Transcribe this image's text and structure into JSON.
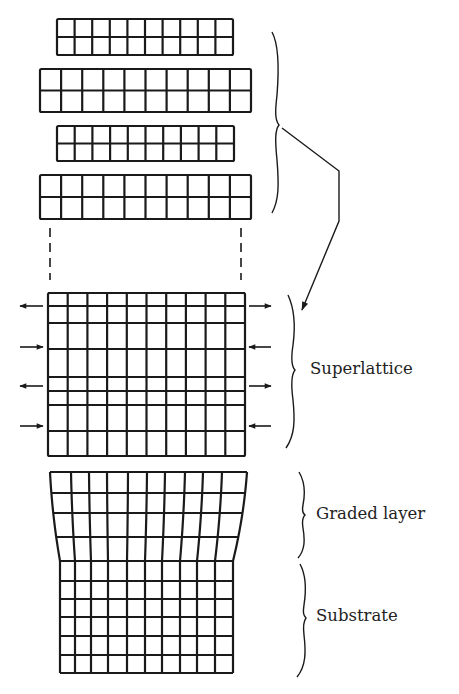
{
  "figure": {
    "ink_color": "#1a1a1a",
    "background": "#ffffff"
  },
  "labels": {
    "superlattice": "Superlattice",
    "graded_layer": "Graded layer",
    "substrate": "Substrate"
  },
  "layers_before": [
    {
      "name": "layer-a-top",
      "x": 57,
      "y": 19,
      "w": 176,
      "h": 36,
      "cols": 10,
      "rows": 2
    },
    {
      "name": "layer-b-top",
      "x": 40,
      "y": 69,
      "w": 211,
      "h": 43,
      "cols": 10,
      "rows": 2
    },
    {
      "name": "layer-a-bottom",
      "x": 57,
      "y": 126,
      "w": 177,
      "h": 35,
      "cols": 10,
      "rows": 2
    },
    {
      "name": "layer-b-bottom",
      "x": 40,
      "y": 175,
      "w": 211,
      "h": 44,
      "cols": 10,
      "rows": 2
    }
  ],
  "superlattice": {
    "x": 48,
    "y": 293,
    "w": 197,
    "h": 163,
    "cols": 10,
    "row_lines": [
      293,
      306,
      323,
      349,
      377,
      391,
      405,
      431,
      456
    ],
    "strain_arrows": [
      {
        "y": 306,
        "left": "outward",
        "right": "outward"
      },
      {
        "y": 347,
        "left": "inward",
        "right": "inward"
      },
      {
        "y": 386,
        "left": "outward",
        "right": "outward"
      },
      {
        "y": 426,
        "left": "inward",
        "right": "inward"
      }
    ]
  },
  "graded_layer": {
    "top_y": 472,
    "bottom_y": 561,
    "row_lines": [
      472,
      493,
      513,
      537,
      561
    ],
    "top_x": [
      50,
      71,
      89,
      107,
      128,
      147,
      165,
      185,
      203,
      222,
      247
    ],
    "bottom_x": [
      60,
      75,
      91,
      108,
      127,
      145,
      162,
      180,
      197,
      215,
      233
    ]
  },
  "substrate": {
    "x": [
      60,
      75,
      91,
      108,
      127,
      145,
      162,
      180,
      197,
      215,
      233
    ],
    "row_lines": [
      561,
      581,
      599,
      617,
      636,
      655,
      673
    ]
  }
}
